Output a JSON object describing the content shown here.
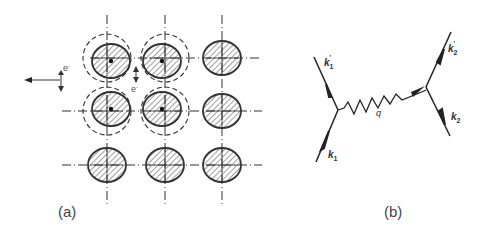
{
  "panel_a": {
    "label": "(a)",
    "electron_label_left": "e",
    "electron_label_center": "e",
    "electron_sup": "-",
    "lattice": {
      "rows": 3,
      "cols": 3
    },
    "displaced_atoms": [
      [
        0,
        0
      ],
      [
        0,
        1
      ],
      [
        1,
        0
      ],
      [
        1,
        1
      ]
    ]
  },
  "panel_b": {
    "label": "(b)",
    "k1": "k",
    "k1_sub": "1",
    "k1p": "k",
    "k1p_sub": "1",
    "k1p_prime": "'",
    "k2": "k",
    "k2_sub": "2",
    "k2p": "k",
    "k2p_sub": "2",
    "k2p_prime": "'",
    "q": "q"
  }
}
